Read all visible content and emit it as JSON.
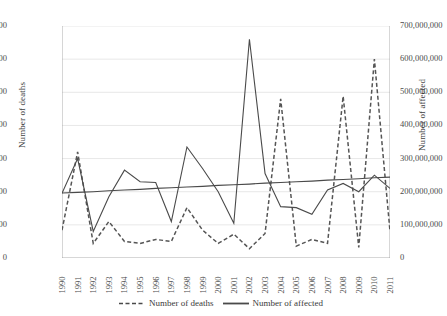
{
  "chart_data": {
    "type": "line",
    "title": "",
    "xlabel": "",
    "categories": [
      "1990",
      "1991",
      "1992",
      "1993",
      "1994",
      "1995",
      "1996",
      "1997",
      "1998",
      "1999",
      "2000",
      "2001",
      "2002",
      "2003",
      "2004",
      "2005",
      "2006",
      "2007",
      "2008",
      "2009",
      "2010",
      "2011"
    ],
    "grid": true,
    "legend_position": "bottom",
    "axes": {
      "left": {
        "label": "Number of deaths",
        "min": 0,
        "max": 350000,
        "step": 50000,
        "ticks": [
          "0",
          "50,000",
          "100,000",
          "150,000",
          "200,000",
          "250,000",
          "300,000",
          "350,000"
        ]
      },
      "right": {
        "label": "Number of affected",
        "min": 0,
        "max": 700000000,
        "step": 100000000,
        "ticks": [
          "0",
          "100,000,000",
          "200,000,000",
          "300,000,000",
          "400,000,000",
          "500,000,000",
          "600,000,000",
          "700,000,000"
        ]
      }
    },
    "series": [
      {
        "name": "Number of deaths",
        "axis": "left",
        "style": "dashed",
        "color": "#555555",
        "values": [
          42000,
          160000,
          22000,
          55000,
          25000,
          22000,
          28000,
          25000,
          76000,
          42000,
          22000,
          36000,
          14000,
          37000,
          240000,
          18000,
          28000,
          22000,
          244000,
          16000,
          300000,
          40000
        ]
      },
      {
        "name": "Number of affected",
        "axis": "right",
        "style": "solid",
        "color": "#4a4a4a",
        "values": [
          195000000,
          300000000,
          80000000,
          185000000,
          265000000,
          230000000,
          228000000,
          110000000,
          335000000,
          270000000,
          200000000,
          105000000,
          660000000,
          255000000,
          155000000,
          152000000,
          132000000,
          205000000,
          225000000,
          200000000,
          250000000,
          210000000
        ]
      },
      {
        "name": "Number of affected trend",
        "axis": "right",
        "style": "solid",
        "color": "#4a4a4a",
        "values": [
          196000000,
          198000000,
          200000000,
          203000000,
          205000000,
          207000000,
          210000000,
          212000000,
          214000000,
          216000000,
          219000000,
          221000000,
          223000000,
          226000000,
          228000000,
          230000000,
          232000000,
          235000000,
          237000000,
          239000000,
          242000000,
          244000000
        ]
      }
    ],
    "legend": [
      {
        "label": "Number of deaths",
        "style": "dashed"
      },
      {
        "label": "Number of affected",
        "style": "solid"
      }
    ]
  }
}
